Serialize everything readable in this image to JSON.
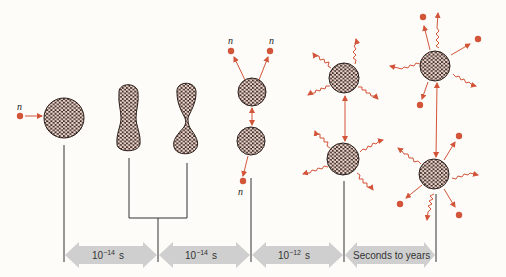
{
  "diagram": {
    "neutron_label": "n",
    "colors": {
      "background": "#fdfcf8",
      "nucleus_fill": "#3a2a26",
      "nucleon": "#f2d9cf",
      "accent": "#d2553a",
      "line": "#333333",
      "timeline_arrow": "#cfcfcf"
    },
    "stages": [
      {
        "name": "incoming-neutron-and-nucleus",
        "description": "Neutron approaches nucleus"
      },
      {
        "name": "elongated-nucleus",
        "description": "Nucleus elongates"
      },
      {
        "name": "necked-nucleus",
        "description": "Nucleus forms neck"
      },
      {
        "name": "scission",
        "description": "Two fragments separate, prompt neutrons emitted"
      },
      {
        "name": "gamma-emission",
        "description": "Fragments emit gamma rays"
      },
      {
        "name": "beta-decay",
        "description": "Fragments emit neutrons/beta particles and gamma rays"
      }
    ],
    "timeline": [
      {
        "base": "10",
        "exp": "−14",
        "unit": "s"
      },
      {
        "base": "10",
        "exp": "−14",
        "unit": "s"
      },
      {
        "base": "10",
        "exp": "−12",
        "unit": "s"
      },
      {
        "text": "Seconds to years"
      }
    ]
  }
}
